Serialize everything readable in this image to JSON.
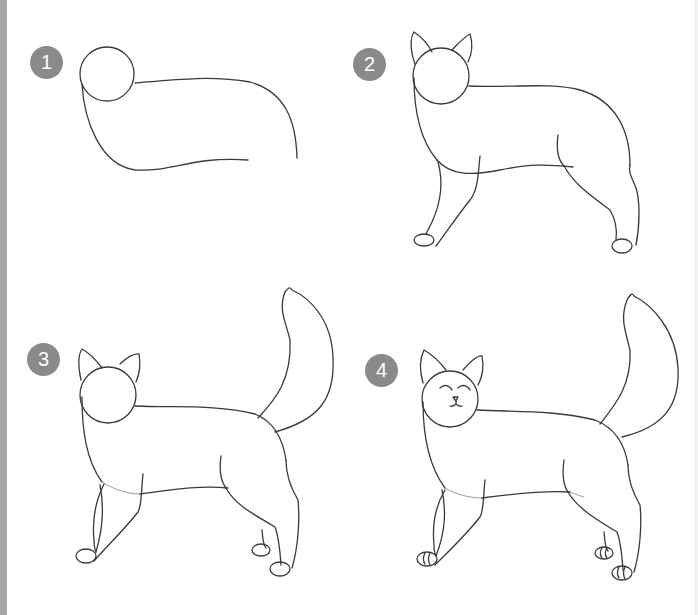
{
  "colors": {
    "badge_bg": "#8a8a8a",
    "badge_text": "#ffffff",
    "line": "#3a3a3a",
    "edge_bar": "#a8a8a8",
    "background": "#ffffff"
  },
  "steps": [
    {
      "number": "1",
      "description": "head circle with body guide curves"
    },
    {
      "number": "2",
      "description": "ears, body outline and legs with paws"
    },
    {
      "number": "3",
      "description": "adds tail and back legs"
    },
    {
      "number": "4",
      "description": "adds face with closed eyes, nose, mouth and toe lines"
    }
  ]
}
